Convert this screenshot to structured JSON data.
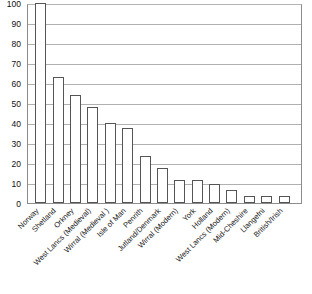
{
  "chart_data": {
    "type": "bar",
    "title": "",
    "subtitle": "",
    "xlabel": "",
    "ylabel": "",
    "ylim": [
      0,
      100
    ],
    "yticks": [
      0,
      10,
      20,
      30,
      40,
      50,
      60,
      70,
      80,
      90,
      100
    ],
    "grid": true,
    "legend": false,
    "legend_position": "none",
    "bar_fill_color": "#ffffff",
    "bar_border_color": "#555555",
    "gridline_color": "#b0b0b0",
    "axis_color": "#8c8c8c",
    "background_color": "#ffffff",
    "categories": [
      "Norway",
      "Shetland",
      "Orkney",
      "West Lancs (Medieval)",
      "Wirral (Medieval )",
      "Isle of Man",
      "Penrith",
      "Jutland/Denmark",
      "Wirral (Modern)",
      "York",
      "Holland",
      "West Lancs (Modern)",
      "Mid-Cheshire",
      "Llangefni",
      "British/Irish"
    ],
    "values": [
      100,
      63,
      54,
      48,
      40,
      37.5,
      23.5,
      17.5,
      11.5,
      11.5,
      9.5,
      6.5,
      3.5,
      3.5,
      3.5
    ]
  }
}
